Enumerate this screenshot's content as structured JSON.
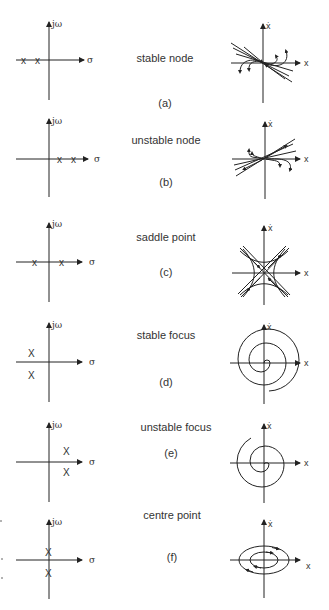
{
  "figure": {
    "panels": [
      {
        "id": "a",
        "tag": "(a)",
        "label": "stable node",
        "poles": "two real negative",
        "pole_plot": {
          "vertical_axis": "jω",
          "horizontal_axis": "σ",
          "pole_marker": "X"
        },
        "phase_plot": {
          "vertical_axis": "ẋ",
          "horizontal_axis": "x"
        }
      },
      {
        "id": "b",
        "tag": "(b)",
        "label": "unstable node",
        "poles": "two real positive",
        "pole_plot": {
          "vertical_axis": "jω",
          "horizontal_axis": "σ",
          "pole_marker": "X"
        },
        "phase_plot": {
          "vertical_axis": "ẋ",
          "horizontal_axis": "x"
        }
      },
      {
        "id": "c",
        "tag": "(c)",
        "label": "saddle point",
        "poles": "one negative, one positive real",
        "pole_plot": {
          "vertical_axis": "jω",
          "horizontal_axis": "σ",
          "pole_marker": "X"
        },
        "phase_plot": {
          "vertical_axis": "ẋ",
          "horizontal_axis": "x"
        }
      },
      {
        "id": "d",
        "tag": "(d)",
        "label": "stable focus",
        "poles": "complex pair, negative real part",
        "pole_plot": {
          "vertical_axis": "jω",
          "horizontal_axis": "σ",
          "pole_marker": "X"
        },
        "phase_plot": {
          "vertical_axis": "ẋ",
          "horizontal_axis": "x"
        }
      },
      {
        "id": "e",
        "tag": "(e)",
        "label": "unstable focus",
        "poles": "complex pair, positive real part",
        "pole_plot": {
          "vertical_axis": "jω",
          "horizontal_axis": "σ",
          "pole_marker": "X"
        },
        "phase_plot": {
          "vertical_axis": "ẋ",
          "horizontal_axis": "x"
        }
      },
      {
        "id": "f",
        "tag": "(f)",
        "label": "centre point",
        "poles": "imaginary pair",
        "pole_plot": {
          "vertical_axis": "jω",
          "horizontal_axis": "σ",
          "pole_marker": "X"
        },
        "phase_plot": {
          "vertical_axis": "ẋ",
          "horizontal_axis": "x"
        }
      }
    ],
    "colors": {
      "ink": "#222222",
      "background": "#ffffff"
    }
  }
}
